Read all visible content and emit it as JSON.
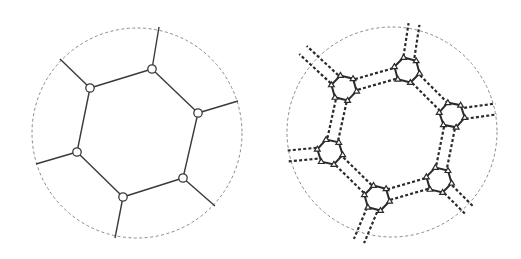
{
  "figure": {
    "colors": {
      "background": "#ffffff",
      "boundary": "#8a8a8a",
      "bond": "#3a3a3a",
      "node_fill": "#ffffff",
      "node_stroke": "#3a3a3a",
      "linker": "#2a2a2a",
      "triangle_stroke": "#2a2a2a"
    },
    "panels": [
      {
        "id": "simple-network",
        "node_shape": "circle",
        "bond_style": "solid-single",
        "node_count": 6,
        "ring_bonds": 6,
        "outward_bonds": 6
      },
      {
        "id": "expanded-network",
        "node_shape": "hexagon-with-triangles",
        "bond_style": "dashed-double",
        "node_count": 6,
        "triangles_per_node": 6,
        "ring_bonds": 6,
        "outward_bonds": 6
      }
    ]
  }
}
